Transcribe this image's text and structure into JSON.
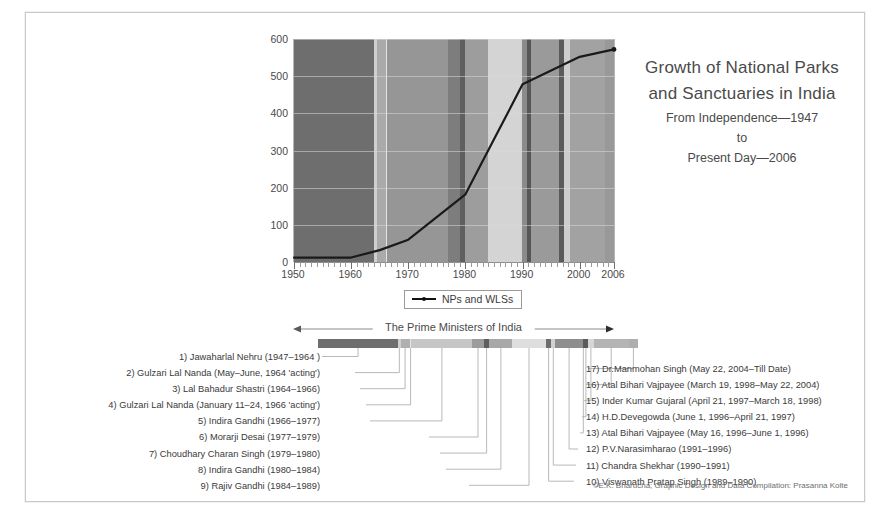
{
  "title": {
    "line1": "Growth of National Parks",
    "line2": "and Sanctuaries in India",
    "sub1": "From Independence—1947",
    "sub2": "to",
    "sub3": "Present Day—2006"
  },
  "chart_legend": {
    "label": "NPs and WLSs",
    "marker": "line-with-point-marker"
  },
  "pm_header": {
    "label": "The Prime Ministers of India"
  },
  "credits": "©E.K. Bharucha; Graphic Design and Data Compilation: Prasanna Kolte",
  "prime_ministers_left": [
    "1) Jawaharlal Nehru (1947–1964 )",
    "2) Gulzari Lal Nanda (May–June, 1964 'acting')",
    "3) Lal Bahadur Shastri (1964–1966)",
    "4) Gulzari Lal Nanda (January 11–24,  1966 'acting')",
    "5) Indira Gandhi (1966–1977)",
    "6) Morarji Desai (1977–1979)",
    "7) Choudhary Charan Singh (1979–1980)",
    "8) Indira Gandhi (1980–1984)",
    "9) Rajiv Gandhi (1984–1989)"
  ],
  "prime_ministers_right": [
    "17) Dr.Manmohan Singh (May 22, 2004–Till Date)",
    "16) Atal Bihari Vajpayee (March 19, 1998–May 22, 2004)",
    "15) Inder Kumar Gujaral (April 21, 1997–March 18, 1998)",
    "14) H.D.Devegowda (June 1, 1996–April 21, 1997)",
    "13) Atal Bihari Vajpayee (May 16, 1996–June 1, 1996)",
    "12) P.V.Narasimharao (1991–1996)",
    "11) Chandra Shekhar (1990–1991)",
    "10) Viswanath Pratap Singh (1989–1990)"
  ],
  "chart_data": {
    "type": "line",
    "title": "Growth of National Parks and Sanctuaries in India",
    "xlabel": "",
    "ylabel": "",
    "xlim": [
      1950,
      2006
    ],
    "ylim": [
      0,
      600
    ],
    "ytick_labels": [
      "0",
      "100",
      "200",
      "300",
      "400",
      "500",
      "600"
    ],
    "yticks": [
      0,
      100,
      200,
      300,
      400,
      500,
      600
    ],
    "xtick_labels": [
      "1950",
      "1960",
      "1970",
      "1980",
      "1990",
      "2000",
      "2006"
    ],
    "xticks": [
      1950,
      1960,
      1970,
      1980,
      1990,
      2000,
      2006
    ],
    "grid": true,
    "legend_position": "below-axes",
    "series": [
      {
        "name": "NPs and WLSs",
        "color": "#1a1a1a",
        "x": [
          1950,
          1960,
          1965,
          1970,
          1980,
          1985,
          1990,
          2000,
          2006
        ],
        "values": [
          12,
          12,
          32,
          60,
          182,
          330,
          478,
          552,
          572
        ]
      }
    ],
    "background_bands": [
      {
        "pm": 1,
        "start": 1950,
        "end": 1964.0,
        "color": "#6e6e6e"
      },
      {
        "pm": 2,
        "start": 1964.0,
        "end": 1964.45,
        "color": "#cfcfcf"
      },
      {
        "pm": 3,
        "start": 1964.45,
        "end": 1966.05,
        "color": "#aaaaaa"
      },
      {
        "pm": 4,
        "start": 1966.05,
        "end": 1966.35,
        "color": "#e3e3e3"
      },
      {
        "pm": 5,
        "start": 1966.35,
        "end": 1977.0,
        "color": "#969696"
      },
      {
        "pm": 6,
        "start": 1977.0,
        "end": 1979.0,
        "color": "#7d7d7d"
      },
      {
        "pm": 7,
        "start": 1979.0,
        "end": 1980.0,
        "color": "#5f5f5f"
      },
      {
        "pm": 8,
        "start": 1980.0,
        "end": 1984.0,
        "color": "#9d9d9d"
      },
      {
        "pm": 9,
        "start": 1984.0,
        "end": 1989.85,
        "color": "#d4d4d4"
      },
      {
        "pm": 10,
        "start": 1989.85,
        "end": 1990.85,
        "color": "#8b8b8b"
      },
      {
        "pm": 11,
        "start": 1990.85,
        "end": 1991.5,
        "color": "#565656"
      },
      {
        "pm": 12,
        "start": 1991.5,
        "end": 1996.4,
        "color": "#9a9a9a"
      },
      {
        "pm": 13,
        "start": 1996.4,
        "end": 1996.45,
        "color": "#6a6a6a"
      },
      {
        "pm": 14,
        "start": 1996.45,
        "end": 1997.3,
        "color": "#5a5a5a"
      },
      {
        "pm": 15,
        "start": 1997.3,
        "end": 1998.22,
        "color": "#cdcdcd"
      },
      {
        "pm": 16,
        "start": 1998.22,
        "end": 2004.4,
        "color": "#a2a2a2"
      },
      {
        "pm": 17,
        "start": 2004.4,
        "end": 2006,
        "color": "#999999"
      }
    ]
  },
  "pm_bar_segments": [
    {
      "pm": 1,
      "start": 1950,
      "end": 1964.0,
      "color": "#6e6e6e"
    },
    {
      "pm": 2,
      "start": 1964.0,
      "end": 1964.45,
      "color": "#cfcfcf"
    },
    {
      "pm": 3,
      "start": 1964.45,
      "end": 1966.05,
      "color": "#b0b0b0"
    },
    {
      "pm": 4,
      "start": 1966.05,
      "end": 1966.35,
      "color": "#e6e6e6"
    },
    {
      "pm": 5,
      "start": 1966.35,
      "end": 1977.0,
      "color": "#c6c6c6"
    },
    {
      "pm": 6,
      "start": 1977.0,
      "end": 1979.0,
      "color": "#9c9c9c"
    },
    {
      "pm": 7,
      "start": 1979.0,
      "end": 1980.0,
      "color": "#5e5e5e"
    },
    {
      "pm": 8,
      "start": 1980.0,
      "end": 1984.0,
      "color": "#a8a8a8"
    },
    {
      "pm": 9,
      "start": 1984.0,
      "end": 1989.85,
      "color": "#dedede"
    },
    {
      "pm": 10,
      "start": 1989.85,
      "end": 1990.85,
      "color": "#6d6d6d"
    },
    {
      "pm": 11,
      "start": 1990.85,
      "end": 1991.5,
      "color": "#d0d0d0"
    },
    {
      "pm": 12,
      "start": 1991.5,
      "end": 1996.4,
      "color": "#8e8e8e"
    },
    {
      "pm": 13,
      "start": 1996.4,
      "end": 1996.45,
      "color": "#555555"
    },
    {
      "pm": 14,
      "start": 1996.45,
      "end": 1997.3,
      "color": "#5a5a5a"
    },
    {
      "pm": 15,
      "start": 1997.3,
      "end": 1998.22,
      "color": "#d6d6d6"
    },
    {
      "pm": 16,
      "start": 1998.22,
      "end": 2004.4,
      "color": "#b4b4b4"
    },
    {
      "pm": 17,
      "start": 2004.4,
      "end": 2006,
      "color": "#aeaeae"
    }
  ]
}
